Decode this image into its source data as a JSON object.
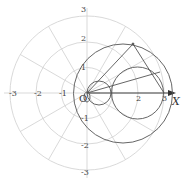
{
  "diagram": {
    "type": "polar-coordinate-grid-with-circles",
    "axis_label": "X",
    "origin_label": "O",
    "x_tick_labels": [
      "-3",
      "-2",
      "-1",
      "2",
      "3"
    ],
    "y_tick_labels_up": [
      "1",
      "2",
      "3"
    ],
    "y_tick_labels_down": [
      "-1",
      "-2",
      "-3"
    ],
    "grid_radii": [
      1,
      2,
      3
    ],
    "ray_angles_deg": [
      30,
      60,
      120,
      150,
      210,
      240,
      300,
      330
    ],
    "colors": {
      "grid": "#c8c8c8",
      "curve": "#555555",
      "axis": "#333333",
      "text": "#444444",
      "background": "#ffffff"
    }
  }
}
